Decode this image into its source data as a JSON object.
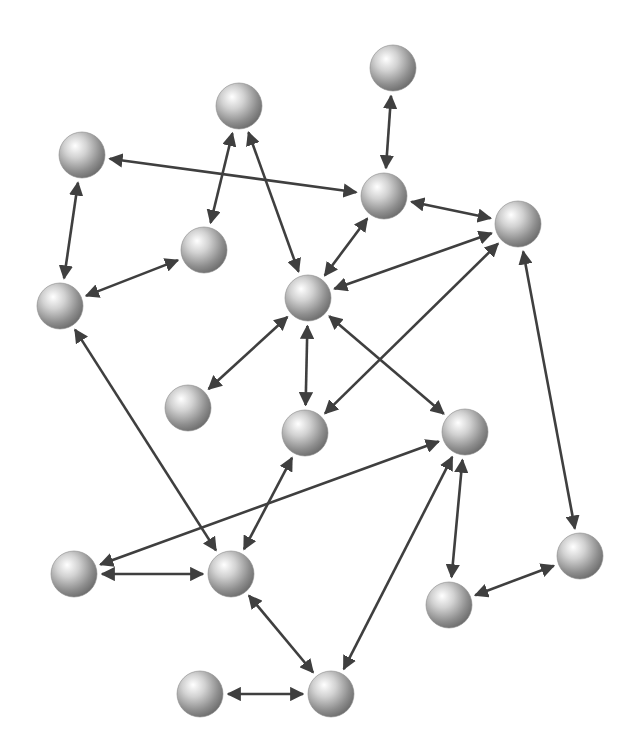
{
  "diagram": {
    "type": "network-graph",
    "directed": "bidirectional",
    "node_radius": 23,
    "colors": {
      "background": "#ffffff",
      "edge": "#3f3f3f",
      "node_highlight": "#ffffff",
      "node_mid": "#b9b9b9",
      "node_shadow": "#6e6e6e"
    },
    "nodes": [
      {
        "id": "n1",
        "x": 393,
        "y": 68
      },
      {
        "id": "n2",
        "x": 239,
        "y": 106
      },
      {
        "id": "n3",
        "x": 82,
        "y": 155
      },
      {
        "id": "n4",
        "x": 384,
        "y": 196
      },
      {
        "id": "n5",
        "x": 518,
        "y": 224
      },
      {
        "id": "n6",
        "x": 204,
        "y": 250
      },
      {
        "id": "n7",
        "x": 60,
        "y": 306
      },
      {
        "id": "n8",
        "x": 308,
        "y": 298
      },
      {
        "id": "n9",
        "x": 188,
        "y": 408
      },
      {
        "id": "n10",
        "x": 305,
        "y": 433
      },
      {
        "id": "n11",
        "x": 465,
        "y": 432
      },
      {
        "id": "n12",
        "x": 74,
        "y": 574
      },
      {
        "id": "n13",
        "x": 231,
        "y": 574
      },
      {
        "id": "n14",
        "x": 580,
        "y": 556
      },
      {
        "id": "n15",
        "x": 449,
        "y": 605
      },
      {
        "id": "n16",
        "x": 200,
        "y": 694
      },
      {
        "id": "n17",
        "x": 331,
        "y": 694
      }
    ],
    "edges": [
      {
        "from": "n1",
        "to": "n4"
      },
      {
        "from": "n3",
        "to": "n4"
      },
      {
        "from": "n3",
        "to": "n7"
      },
      {
        "from": "n2",
        "to": "n6"
      },
      {
        "from": "n2",
        "to": "n8"
      },
      {
        "from": "n6",
        "to": "n7"
      },
      {
        "from": "n4",
        "to": "n8"
      },
      {
        "from": "n4",
        "to": "n5"
      },
      {
        "from": "n5",
        "to": "n8"
      },
      {
        "from": "n5",
        "to": "n10"
      },
      {
        "from": "n5",
        "to": "n14"
      },
      {
        "from": "n7",
        "to": "n13"
      },
      {
        "from": "n8",
        "to": "n9"
      },
      {
        "from": "n8",
        "to": "n10"
      },
      {
        "from": "n8",
        "to": "n11"
      },
      {
        "from": "n10",
        "to": "n13"
      },
      {
        "from": "n11",
        "to": "n12"
      },
      {
        "from": "n11",
        "to": "n17"
      },
      {
        "from": "n11",
        "to": "n15"
      },
      {
        "from": "n15",
        "to": "n14"
      },
      {
        "from": "n12",
        "to": "n13"
      },
      {
        "from": "n13",
        "to": "n17"
      },
      {
        "from": "n16",
        "to": "n17"
      }
    ]
  }
}
